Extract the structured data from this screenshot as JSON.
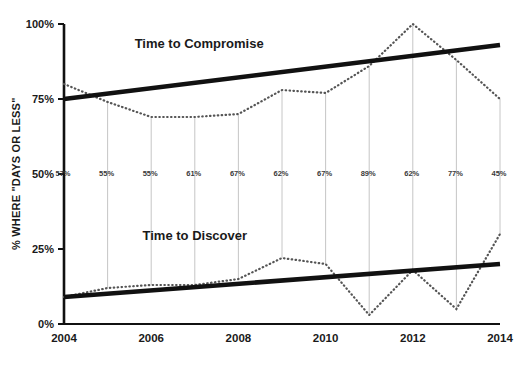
{
  "chart_data": {
    "type": "line",
    "title": "",
    "xlabel": "",
    "ylabel": "% WHERE \"DAYS OR LESS\"",
    "ylim": [
      0,
      100
    ],
    "xlim": [
      2004,
      2014
    ],
    "grid": false,
    "legend_position": "inline-annotation",
    "y_ticks": [
      "0%",
      "25%",
      "50%",
      "75%",
      "100%"
    ],
    "y_tick_values": [
      0,
      25,
      50,
      75,
      100
    ],
    "x_ticks": [
      "2004",
      "2006",
      "2008",
      "2010",
      "2012",
      "2014"
    ],
    "x_tick_values": [
      2004,
      2006,
      2008,
      2010,
      2012,
      2014
    ],
    "x": [
      2004,
      2005,
      2006,
      2007,
      2008,
      2009,
      2010,
      2011,
      2012,
      2013,
      2014
    ],
    "series": [
      {
        "name": "Time to Compromise",
        "style": "dotted",
        "values": [
          80,
          74,
          69,
          69,
          70,
          78,
          77,
          86,
          100,
          88,
          75
        ]
      },
      {
        "name": "Time to Discover",
        "style": "dotted",
        "values": [
          9,
          12,
          13,
          13,
          15,
          22,
          20,
          3,
          18,
          5,
          30
        ]
      },
      {
        "name": "Time to Compromise trend",
        "style": "solid-thick",
        "values": [
          75,
          76.8,
          78.6,
          80.4,
          82.2,
          84,
          85.8,
          87.6,
          89.4,
          91.2,
          93
        ]
      },
      {
        "name": "Time to Discover trend",
        "style": "solid-thick",
        "values": [
          9,
          10.1,
          11.2,
          12.3,
          13.4,
          14.5,
          15.6,
          16.7,
          17.8,
          18.9,
          20
        ]
      }
    ],
    "annotations": [
      {
        "text": "Time to Compromise",
        "x": 2007.1,
        "y": 92
      },
      {
        "text": "Time to Discover",
        "x": 2007.0,
        "y": 28
      }
    ],
    "point_labels": [
      "57%",
      "55%",
      "55%",
      "61%",
      "67%",
      "62%",
      "67%",
      "89%",
      "62%",
      "77%",
      "45%"
    ],
    "point_label_y": 50,
    "colors": {
      "trend": "#111111",
      "dotted": "#555555",
      "connector": "#bfbfbf",
      "axis": "#111111",
      "text": "#1a1a1a"
    }
  }
}
